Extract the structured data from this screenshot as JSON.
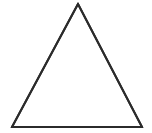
{
  "figure": {
    "title": "Triangle",
    "shape_name": "triangle",
    "shape_type": "isosceles-triangle",
    "background_color": "#ffffff",
    "stroke_color": "#2b2b2b",
    "stroke_width": 2,
    "canvas": {
      "width": 152,
      "height": 133
    },
    "vertices": [
      {
        "label": "apex",
        "x": 78,
        "y": 4
      },
      {
        "label": "bottom-right",
        "x": 142,
        "y": 127
      },
      {
        "label": "bottom-left",
        "x": 12,
        "y": 127
      }
    ],
    "path": "M 78 4 L 142 127 L 12 127 Z",
    "edges": [
      {
        "label": "left-edge",
        "from": "bottom-left",
        "to": "apex"
      },
      {
        "label": "right-edge",
        "from": "apex",
        "to": "bottom-right"
      },
      {
        "label": "base-edge",
        "from": "bottom-left",
        "to": "bottom-right"
      }
    ],
    "labels": [],
    "annotations": []
  }
}
